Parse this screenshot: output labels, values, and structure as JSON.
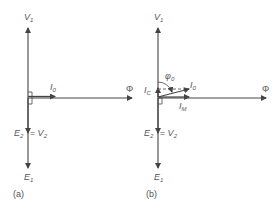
{
  "diagram": {
    "colors": {
      "line": "#444444",
      "text": "#555555",
      "background": "#ffffff"
    },
    "panels": [
      {
        "id": "a",
        "caption": "(a)",
        "labels": {
          "v1": "V",
          "v1_sub": "1",
          "i0": "I",
          "i0_sub": "0",
          "phi": "Φ",
          "e2": "E",
          "e2_sub": "2",
          "eq_v2": " = V",
          "v2_sub": "2",
          "e1": "E",
          "e1_sub": "1"
        }
      },
      {
        "id": "b",
        "caption": "(b)",
        "labels": {
          "v1": "V",
          "v1_sub": "1",
          "phi0": "φ",
          "phi0_sub": "0",
          "i0": "I",
          "i0_sub": "0",
          "ic": "I",
          "ic_sub": "C",
          "im": "I",
          "im_sub": "M",
          "phi": "Φ",
          "e2": "E",
          "e2_sub": "2",
          "eq_v2": " = V",
          "v2_sub": "2",
          "e1": "E",
          "e1_sub": "1"
        }
      }
    ]
  }
}
